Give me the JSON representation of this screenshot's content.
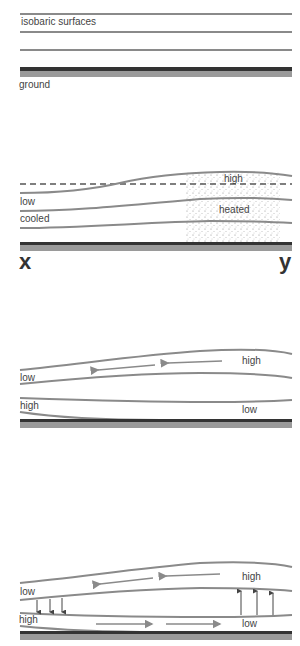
{
  "panel1": {
    "label_isobaric": "isobaric surfaces",
    "label_ground": "ground"
  },
  "panel2": {
    "label_high": "high",
    "label_low": "low",
    "label_heated": "heated",
    "label_cooled": "cooled",
    "label_x": "x",
    "label_y": "y"
  },
  "panel3": {
    "label_high_upper": "high",
    "label_low_upper": "low",
    "label_high_lower": "high",
    "label_low_lower": "low"
  },
  "panel4": {
    "label_high_upper": "high",
    "label_low_upper": "low",
    "label_high_lower": "high",
    "label_low_lower": "low"
  },
  "colors": {
    "isobar": "#8a8a8a",
    "ground_dark": "#333333",
    "ground_light": "#9a9a9a",
    "arrow": "#8a8a8a",
    "vertical_arrow": "#444444"
  }
}
